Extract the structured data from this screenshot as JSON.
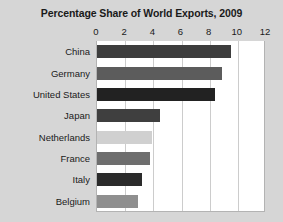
{
  "chart_data": {
    "type": "bar",
    "orientation": "horizontal",
    "title": "Percentage Share of World Exports, 2009",
    "xlabel": "",
    "ylabel": "",
    "xlim": [
      0,
      12
    ],
    "xticks": [
      0,
      2,
      4,
      6,
      8,
      10,
      12
    ],
    "xtick_labels": [
      "0",
      "2",
      "4",
      "6",
      "8",
      "10",
      "12"
    ],
    "grid": true,
    "grid_axis": "x",
    "legend": false,
    "categories": [
      "China",
      "Germany",
      "United States",
      "Japan",
      "Netherlands",
      "France",
      "Italy",
      "Belgium"
    ],
    "values": [
      9.5,
      8.9,
      8.4,
      4.5,
      3.9,
      3.75,
      3.2,
      2.9
    ],
    "bar_colors": [
      "#3d3d3d",
      "#5c5c5c",
      "#222222",
      "#3f3f3f",
      "#d0d0d0",
      "#6e6e6e",
      "#2b2b2b",
      "#8f8f8f"
    ]
  },
  "colors": {
    "figure_background": "#d6d6d6",
    "plot_background": "#ffffff",
    "gridline": "#cccccc",
    "axis_border": "#b3b3b3",
    "text": "#1a1a1a"
  }
}
